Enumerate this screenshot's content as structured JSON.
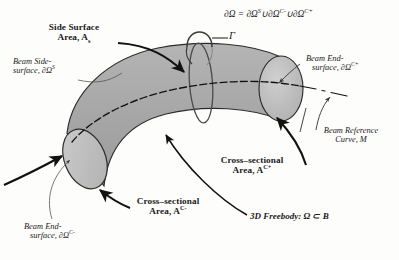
{
  "figure": {
    "type": "engineering-diagram",
    "background_color": "#fdfdfc",
    "body_fill": "#a9a9a9",
    "endcap_fill": "#c2c2c2",
    "outline_color": "#2b2b2b"
  },
  "equation": {
    "text": "∂Ω = ∂Ω",
    "sup1": "S",
    "union1": "∪∂Ω",
    "sup2": "C-",
    "union2": "∪∂Ω",
    "sup3": "C+"
  },
  "labels": {
    "side_surface_area": {
      "line1": "Side Surface",
      "line2": "Area, A",
      "sub": "s"
    },
    "beam_side_surface": {
      "line1": "Beam Side-",
      "line2": "surface, ∂Ω",
      "sup": "S"
    },
    "gamma": "Γ",
    "beam_end_surface_plus": {
      "line1": "Beam End-",
      "line2": "surface, ∂Ω",
      "sup": "C+"
    },
    "beam_reference_curve": {
      "line1": "Beam Reference",
      "line2": "Curve, M"
    },
    "cross_sectional_plus": {
      "line1": "Cross–sectional",
      "line2": "Area, A",
      "sup": "C+"
    },
    "cross_sectional_minus": {
      "line1": "Cross–sectional",
      "line2": "Area, A",
      "sup": "C-"
    },
    "beam_end_surface_minus": {
      "line1": "Beam End-",
      "line2": "surface, ∂Ω",
      "sup": "C-"
    },
    "freebody": {
      "text": "3D Freebody: Ω ⊂ B"
    }
  }
}
